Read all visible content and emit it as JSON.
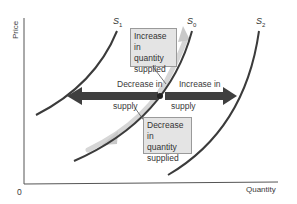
{
  "diagram": {
    "type": "supply-shift-diagram",
    "axes": {
      "y_label": "Price",
      "x_label": "Quantity",
      "origin_label": "0"
    },
    "curves": [
      {
        "id": "S1",
        "name": "S",
        "subscript": "1",
        "position": "left"
      },
      {
        "id": "S0",
        "name": "S",
        "subscript": "0",
        "position": "middle"
      },
      {
        "id": "S2",
        "name": "S",
        "subscript": "2",
        "position": "right"
      }
    ],
    "boxes": {
      "increase_quantity_supplied": [
        "Increase in",
        "quantity",
        "supplied"
      ],
      "decrease_quantity_supplied": [
        "Decrease in",
        "quantity",
        "supplied"
      ]
    },
    "shift_labels": {
      "decrease_line1": "Decrease in",
      "decrease_line2": "supply",
      "increase_line1": "Increase in",
      "increase_line2": "supply"
    },
    "colors": {
      "curve": "#3b3b3b",
      "shift_arrow": "#3f3f3f",
      "movement_arrow": "#c8c8c8",
      "box_fill": "#e4e4e4",
      "box_border": "#9a9a9a",
      "axis": "#555555"
    }
  }
}
